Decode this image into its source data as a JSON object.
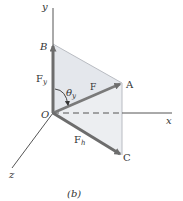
{
  "diagram": {
    "caption": "(b)",
    "axes": {
      "x": "x",
      "y": "y",
      "z": "z"
    },
    "points": {
      "origin": "O",
      "A": "A",
      "B": "B",
      "C": "C"
    },
    "vectors": {
      "F": "F",
      "Fy_main": "F",
      "Fy_sub": "y",
      "Fh_main": "F",
      "Fh_sub": "h"
    },
    "angle": {
      "symbol": "θ",
      "sub": "y"
    },
    "colors": {
      "vector": "#6d6d6d",
      "axis": "#555555",
      "shade": "#e4e7ec",
      "edge": "#b9bcc2"
    }
  }
}
